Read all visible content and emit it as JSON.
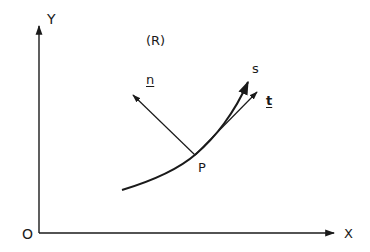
{
  "diagram": {
    "type": "plane curve with tangent and normal unit vectors",
    "axes": {
      "origin_label": "O",
      "x_label": "X",
      "y_label": "Y"
    },
    "region_label": "(R)",
    "curve_label": "s",
    "point_label": "P",
    "tangent_label": "t",
    "normal_label": "n",
    "colors": {
      "line": "#1a1a1a",
      "background": "#ffffff"
    }
  }
}
